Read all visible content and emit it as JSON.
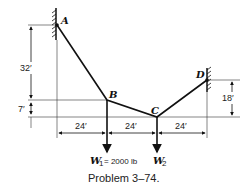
{
  "diagram": {
    "points": {
      "A": {
        "label": "A"
      },
      "B": {
        "label": "B"
      },
      "C": {
        "label": "C"
      },
      "D": {
        "label": "D"
      }
    },
    "dimensions": {
      "vertical_AB": "32′",
      "vertical_BC": "7′",
      "vertical_DC": "18′",
      "horizontal_1": "24′",
      "horizontal_2": "24′",
      "horizontal_3": "24′"
    },
    "loads": {
      "W1": {
        "symbol": "W",
        "subscript": "1",
        "value": "= 2000 lb"
      },
      "W2": {
        "symbol": "W",
        "subscript": "2",
        "value": ""
      }
    },
    "caption": "Problem 3–74."
  }
}
